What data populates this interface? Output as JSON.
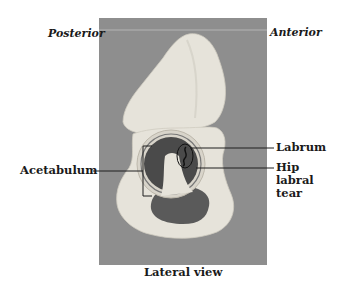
{
  "figure": {
    "orientation_labels": {
      "left": "Posterior",
      "right": "Anterior"
    },
    "callouts": {
      "acetabulum": "Acetabulum",
      "labrum": "Labrum",
      "hip_labral_tear": "Hip labral tear"
    },
    "caption": "Lateral view",
    "colors": {
      "photo_background": "#8e8e8e",
      "bone": "#e6e3da",
      "acetabulum_cavity": "#4a4a4a",
      "label_text": "#1a1a1a",
      "leader_line": "#1f1f1f"
    }
  }
}
